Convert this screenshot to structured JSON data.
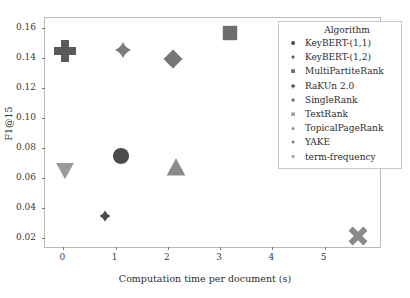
{
  "chart_data": {
    "type": "scatter",
    "title": "",
    "xlabel": "Computation time per document (s)",
    "ylabel": "F1@15",
    "xlim": [
      -0.35,
      6.1
    ],
    "ylim": [
      0.0125,
      0.1665
    ],
    "xticks": [
      "0",
      "1",
      "2",
      "3",
      "4",
      "5"
    ],
    "xtick_values": [
      0,
      1,
      2,
      3,
      4,
      5
    ],
    "yticks": [
      "0.02",
      "0.04",
      "0.06",
      "0.08",
      "0.10",
      "0.12",
      "0.14",
      "0.16"
    ],
    "ytick_values": [
      0.02,
      0.04,
      0.06,
      0.08,
      0.1,
      0.12,
      0.14,
      0.16
    ],
    "grid": false,
    "legend_position": "upper right",
    "legend_title": "Algorithm",
    "series": [
      {
        "name": "KeyBERT-(1,1)",
        "marker": "circle",
        "color": "#4c4c4c",
        "size": 17,
        "x": [
          1.1
        ],
        "y": [
          0.0745
        ]
      },
      {
        "name": "KeyBERT-(1,2)",
        "marker": "star4",
        "color": "#4a4a4a",
        "size": 11,
        "x": [
          0.8
        ],
        "y": [
          0.0345
        ]
      },
      {
        "name": "MultiPartiteRank",
        "marker": "square",
        "color": "#6d6d6d",
        "size": 16,
        "x": [
          3.2
        ],
        "y": [
          0.1565
        ]
      },
      {
        "name": "RaKUn 2.0",
        "marker": "plus",
        "color": "#5a5a5a",
        "size": 22,
        "x": [
          0.03
        ],
        "y": [
          0.1445
        ]
      },
      {
        "name": "SingleRank",
        "marker": "diamond",
        "color": "#757575",
        "size": 19,
        "x": [
          2.1
        ],
        "y": [
          0.1395
        ]
      },
      {
        "name": "TextRank",
        "marker": "x",
        "color": "#8a8a8a",
        "size": 19,
        "x": [
          5.65
        ],
        "y": [
          0.0215
        ]
      },
      {
        "name": "TopicalPageRank",
        "marker": "triangle-up",
        "color": "#8c8c8c",
        "size": 20,
        "x": [
          2.15
        ],
        "y": [
          0.0675
        ]
      },
      {
        "name": "YAKE",
        "marker": "star4",
        "color": "#7d7d7d",
        "size": 16,
        "x": [
          1.15
        ],
        "y": [
          0.1455
        ]
      },
      {
        "name": "term-frequency",
        "marker": "triangle-down",
        "color": "#9b9b9b",
        "size": 19,
        "x": [
          0.03
        ],
        "y": [
          0.0645
        ]
      }
    ]
  }
}
